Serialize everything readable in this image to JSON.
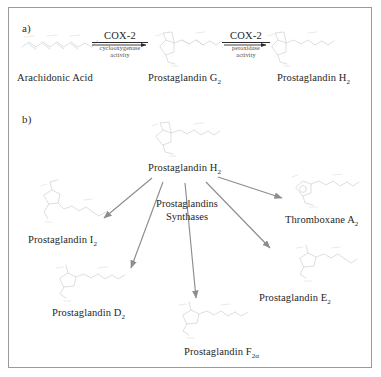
{
  "figure": {
    "panel_a_label": "a)",
    "panel_b_label": "b)"
  },
  "panel_a": {
    "compounds": [
      {
        "name": "Arachidonic Acid",
        "sub": ""
      },
      {
        "name": "Prostaglandin G",
        "sub": "2"
      },
      {
        "name": "Prostaglandin H",
        "sub": "2"
      }
    ],
    "steps": [
      {
        "enzyme": "COX-2",
        "activity_line1": "cyclooxygenase",
        "activity_line2": "activity"
      },
      {
        "enzyme": "COX-2",
        "activity_line1": "peroxidase",
        "activity_line2": "activity"
      }
    ]
  },
  "panel_b": {
    "substrate": {
      "name": "Prostaglandin H",
      "sub": "2"
    },
    "enzyme_label_line1": "Prostaglandins",
    "enzyme_label_line2": "Synthases",
    "products": [
      {
        "name": "Prostaglandin I",
        "sub": "2"
      },
      {
        "name": "Prostaglandin D",
        "sub": "2"
      },
      {
        "name": "Prostaglandin F",
        "sub": "2α"
      },
      {
        "name": "Prostaglandin E",
        "sub": "2"
      },
      {
        "name": "Thromboxane A",
        "sub": "2"
      }
    ]
  },
  "colors": {
    "border": "#9a9a9a",
    "text": "#1f1f1f",
    "arrow": "#8d8d8d",
    "structure": "#d8d8d8",
    "background": "#ffffff"
  }
}
